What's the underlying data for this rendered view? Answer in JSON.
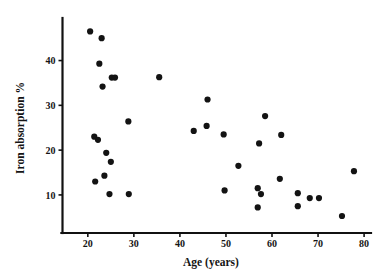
{
  "chart_data": {
    "type": "scatter",
    "title": "",
    "xlabel": "Age (years)",
    "ylabel": "Iron absorption %",
    "xlim": [
      14.5,
      81.5
    ],
    "ylim": [
      1.5,
      49.5
    ],
    "xticks": [
      20,
      30,
      40,
      50,
      60,
      70,
      80
    ],
    "xtick_labels": [
      "20",
      "30",
      "40",
      "50",
      "60",
      "70",
      "80"
    ],
    "yticks": [
      10,
      20,
      30,
      40
    ],
    "ytick_labels": [
      "10",
      "20",
      "30",
      "40"
    ],
    "grid": false,
    "legend": null,
    "marker": "filled-circle",
    "marker_color": "#131313",
    "marker_size_px": 3.1,
    "points": [
      {
        "x": 20.5,
        "y": 46.5
      },
      {
        "x": 23.0,
        "y": 45.0
      },
      {
        "x": 22.5,
        "y": 39.3
      },
      {
        "x": 25.2,
        "y": 36.2
      },
      {
        "x": 25.9,
        "y": 36.2
      },
      {
        "x": 35.5,
        "y": 36.3
      },
      {
        "x": 23.2,
        "y": 34.2
      },
      {
        "x": 46.0,
        "y": 31.3
      },
      {
        "x": 58.5,
        "y": 27.6
      },
      {
        "x": 28.8,
        "y": 26.4
      },
      {
        "x": 45.8,
        "y": 25.4
      },
      {
        "x": 43.0,
        "y": 24.3
      },
      {
        "x": 49.5,
        "y": 23.5
      },
      {
        "x": 62.0,
        "y": 23.4
      },
      {
        "x": 21.4,
        "y": 23.0
      },
      {
        "x": 22.2,
        "y": 22.3
      },
      {
        "x": 57.2,
        "y": 21.5
      },
      {
        "x": 24.0,
        "y": 19.4
      },
      {
        "x": 25.0,
        "y": 17.4
      },
      {
        "x": 52.7,
        "y": 16.5
      },
      {
        "x": 77.8,
        "y": 15.3
      },
      {
        "x": 23.6,
        "y": 14.3
      },
      {
        "x": 61.7,
        "y": 13.6
      },
      {
        "x": 21.6,
        "y": 13.0
      },
      {
        "x": 56.9,
        "y": 11.5
      },
      {
        "x": 49.7,
        "y": 11.0
      },
      {
        "x": 24.7,
        "y": 10.2
      },
      {
        "x": 28.9,
        "y": 10.2
      },
      {
        "x": 57.6,
        "y": 10.2
      },
      {
        "x": 65.6,
        "y": 10.4
      },
      {
        "x": 68.2,
        "y": 9.3
      },
      {
        "x": 70.2,
        "y": 9.3
      },
      {
        "x": 65.6,
        "y": 7.5
      },
      {
        "x": 56.9,
        "y": 7.2
      },
      {
        "x": 75.2,
        "y": 5.3
      }
    ]
  },
  "figure": {
    "background": "#ffffff",
    "axis_color": "#111111"
  }
}
